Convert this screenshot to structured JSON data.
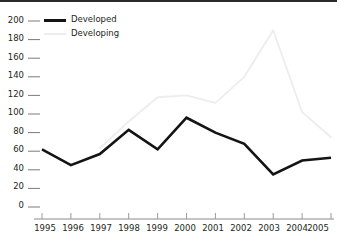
{
  "chart_data": {
    "type": "line",
    "title": "",
    "subtitle": "",
    "xlabel": "",
    "ylabel": "",
    "x": [
      1995,
      1996,
      1997,
      1998,
      1999,
      2000,
      2001,
      2002,
      2003,
      2004,
      2005
    ],
    "xtick_labels": [
      "1995",
      "1996",
      "1997",
      "1998",
      "1999",
      "2000",
      "2001",
      "2002",
      "2003",
      "2004",
      "2005"
    ],
    "ytick_labels": [
      "0",
      "20",
      "40",
      "60",
      "80",
      "100",
      "120",
      "140",
      "160",
      "180",
      "200"
    ],
    "ytick_values": [
      0,
      20,
      40,
      60,
      80,
      100,
      120,
      140,
      160,
      180,
      200
    ],
    "ylim": [
      0,
      200
    ],
    "xlim": [
      1995,
      2005
    ],
    "grid": false,
    "legend_position": "top-left",
    "series": [
      {
        "name": "Developed",
        "color": "#141414",
        "line_width": 2.6,
        "values": [
          62,
          45,
          57,
          83,
          62,
          96,
          80,
          68,
          35,
          50,
          53
        ]
      },
      {
        "name": "Developing",
        "color": "#ededed",
        "line_width": 1.8,
        "values": [
          null,
          null,
          63,
          92,
          118,
          120,
          112,
          140,
          190,
          102,
          75
        ]
      }
    ]
  },
  "legend": {
    "items": [
      {
        "label": "Developed",
        "color": "#141414"
      },
      {
        "label": "Developing",
        "color": "#ededed"
      }
    ]
  },
  "axes": {
    "y_axis_name": "y-axis",
    "x_axis_name": "x-axis"
  }
}
